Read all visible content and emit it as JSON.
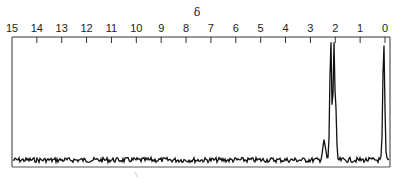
{
  "chart_data": {
    "type": "line",
    "title": "",
    "xlabel": "δ",
    "ylabel": "",
    "x_axis_position": "top",
    "x_reversed": true,
    "xlim": [
      15,
      0
    ],
    "grid": false,
    "legend": null,
    "x_ticks": [
      15,
      14,
      13,
      12,
      11,
      10,
      9,
      8,
      7,
      6,
      5,
      4,
      3,
      2,
      1,
      0
    ],
    "tick_labels": [
      "15",
      "14",
      "13",
      "12",
      "11",
      "10",
      "9",
      "8",
      "7",
      "6",
      "5",
      "4",
      "3",
      "2",
      "1",
      "0"
    ],
    "series": [
      {
        "name": "1H NMR spectrum",
        "baseline": 0.06,
        "peaks": [
          {
            "ppm": 2.18,
            "relative_height": 1.0,
            "note": "tall sharp line"
          },
          {
            "ppm": 2.05,
            "relative_height": 0.98,
            "note": "tall line with shoulder"
          },
          {
            "ppm": 2.0,
            "relative_height": 0.55,
            "note": "shoulder"
          },
          {
            "ppm": 2.45,
            "relative_height": 0.15,
            "note": "small spike"
          },
          {
            "ppm": 0.05,
            "relative_height": 0.97,
            "note": "reference (TMS)"
          }
        ]
      }
    ]
  },
  "axis": {
    "title": "δ"
  }
}
